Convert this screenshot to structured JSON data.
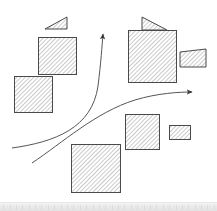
{
  "canvas": {
    "width": 217,
    "height": 211,
    "background_color": "#ffffff",
    "title": "Hatched shapes with curved arrows diagram"
  },
  "style": {
    "stroke_color": "#4a4a4a",
    "hatch_color": "#8a8a8a",
    "hatch_fill_color": "#ffffff",
    "arrow_color": "#555555",
    "stroke_width": 1,
    "hatch_spacing": 3,
    "hatch_angle_degrees": 45
  },
  "bottom_strip": {
    "visible": true,
    "color": "#eaeaea",
    "height": 9,
    "tick_count": 34
  },
  "chart_data": {
    "type": "diagram",
    "shape_count": 10,
    "arrow_count": 2,
    "shapes": [
      {
        "id": "shape-top-left-small",
        "name": "small-triangle-top-left",
        "kind": "triangle-right",
        "x": 45,
        "y": 17,
        "width": 22,
        "height": 12,
        "group": "top-left-cluster",
        "description": "Small right-leaning triangular hatched wedge above the upper-left square"
      },
      {
        "id": "shape-top-left-large",
        "name": "large-square-top-left",
        "kind": "rect",
        "x": 38,
        "y": 37,
        "width": 38,
        "height": 37,
        "group": "top-left-cluster",
        "description": "Large hatched square in the upper-left area"
      },
      {
        "id": "shape-mid-left",
        "name": "medium-square-mid-left",
        "kind": "rect",
        "x": 14,
        "y": 76,
        "width": 38,
        "height": 36,
        "group": "left-cluster",
        "description": "Medium hatched square on the left, below the large square"
      },
      {
        "id": "shape-top-right-small",
        "name": "small-triangle-top-right",
        "kind": "triangle-right",
        "x": 142,
        "y": 17,
        "width": 25,
        "height": 13,
        "group": "top-right-cluster",
        "description": "Small right-leaning triangular hatched wedge above the upper-right square"
      },
      {
        "id": "shape-top-right-large",
        "name": "large-square-top-right",
        "kind": "rect",
        "x": 128,
        "y": 30,
        "width": 48,
        "height": 52,
        "group": "top-right-cluster",
        "description": "Largest hatched square in the upper-right area"
      },
      {
        "id": "shape-right-trapezoid",
        "name": "trapezoid-right",
        "kind": "trapezoid-left-tall",
        "x": 180,
        "y": 49,
        "width": 26,
        "height": 18,
        "group": "top-right-cluster",
        "description": "Small hatched trapezoid with slanted top edge, right of the large square"
      },
      {
        "id": "shape-mid-right",
        "name": "medium-square-mid-right",
        "kind": "rect",
        "x": 125,
        "y": 114,
        "width": 34,
        "height": 35,
        "group": "right-cluster",
        "description": "Medium hatched square in the middle-right area"
      },
      {
        "id": "shape-small-right",
        "name": "small-rect-right",
        "kind": "rect",
        "x": 169,
        "y": 125,
        "width": 21,
        "height": 14,
        "group": "right-cluster",
        "description": "Small hatched rectangle to the right of the middle-right square"
      },
      {
        "id": "shape-bottom-center",
        "name": "large-square-bottom-center",
        "kind": "rect",
        "x": 71,
        "y": 144,
        "width": 49,
        "height": 48,
        "group": "bottom-cluster",
        "description": "Large hatched square at the bottom center"
      }
    ],
    "arrows": [
      {
        "id": "arrow-up",
        "name": "curved-arrow-upward",
        "start": [
          12,
          148
        ],
        "control_1": [
          60,
          140
        ],
        "control_2": [
          95,
          110
        ],
        "end": [
          103,
          30
        ],
        "head_direction": "up",
        "description": "Long S-curved arrow sweeping from lower-left upward to the top center"
      },
      {
        "id": "arrow-right",
        "name": "curved-arrow-rightward",
        "start": [
          32,
          163
        ],
        "control_1": [
          80,
          140
        ],
        "control_2": [
          130,
          100
        ],
        "end": [
          197,
          95
        ],
        "head_direction": "right",
        "description": "Long shallow curved arrow sweeping from lower-left to the middle-right"
      }
    ]
  }
}
